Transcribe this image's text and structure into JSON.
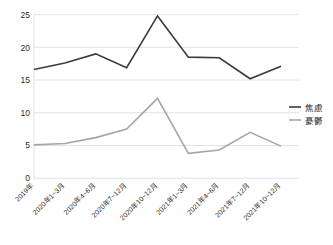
{
  "chart_data": {
    "type": "line",
    "title": "",
    "subtitle": "",
    "xlabel": "",
    "ylabel": "",
    "ylim": [
      0,
      26
    ],
    "yticks": [
      0,
      5,
      10,
      15,
      20,
      25
    ],
    "ytick_labels": [
      "0",
      "5",
      "10",
      "15",
      "20",
      "25"
    ],
    "grid": true,
    "grid_axis": "y",
    "legend_position": "right",
    "categories": [
      "2019年",
      "2020年1~3月",
      "2020年4~6月",
      "2020年7~12月",
      "2020年10~12月",
      "2021年1~3月",
      "2021年4~6月",
      "2021年7~12月",
      "2021年10~12月"
    ],
    "series": [
      {
        "name": "焦慮",
        "color": "#3b3b3b",
        "values": [
          16.6,
          17.6,
          19.0,
          16.9,
          24.8,
          18.5,
          18.4,
          15.2,
          17.1
        ]
      },
      {
        "name": "憂鬱",
        "color": "#a6a6a6",
        "values": [
          5.1,
          5.3,
          6.2,
          7.5,
          12.2,
          3.8,
          4.3,
          7.0,
          4.9
        ]
      }
    ]
  },
  "legend": {
    "entries": [
      {
        "label": "焦慮",
        "color": "#3b3b3b"
      },
      {
        "label": "憂鬱",
        "color": "#a6a6a6"
      }
    ]
  },
  "axis": {
    "y_tick_0": "0",
    "y_tick_1": "5",
    "y_tick_2": "10",
    "y_tick_3": "15",
    "y_tick_4": "20",
    "y_tick_5": "25",
    "x_tick_0": "2019年",
    "x_tick_1": "2020年1~3月",
    "x_tick_2": "2020年4~6月",
    "x_tick_3": "2020年7~12月",
    "x_tick_4": "2020年10~12月",
    "x_tick_5": "2021年1~3月",
    "x_tick_6": "2021年4~6月",
    "x_tick_7": "2021年7~12月",
    "x_tick_8": "2021年10~12月"
  }
}
